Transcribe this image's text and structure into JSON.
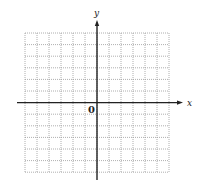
{
  "diagram": {
    "type": "coordinate-grid",
    "grid": {
      "columns": 12,
      "rows": 12,
      "left": 25,
      "top": 33,
      "cell_width": 12,
      "cell_height": 11.6,
      "line_color": "#9a9a9a",
      "line_style": "dotted"
    },
    "axes": {
      "x_label": "x",
      "y_label": "y",
      "origin_label": "0",
      "color": "#222222",
      "x_axis": {
        "x1": 17,
        "x2": 183,
        "y": 102.6
      },
      "y_axis": {
        "x": 97,
        "y1": 20,
        "y2": 180
      }
    }
  }
}
